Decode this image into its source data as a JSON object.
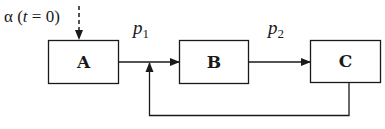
{
  "diagram": {
    "type": "block-flow",
    "colors": {
      "stroke": "#1a1a1a",
      "background": "#ffffff"
    },
    "initial_input": {
      "symbol": "α",
      "open_paren": " (",
      "variable": "t",
      "condition": " = 0)",
      "style": "dashed-arrow",
      "target": "A"
    },
    "nodes": [
      {
        "id": "A",
        "label": "A"
      },
      {
        "id": "B",
        "label": "B"
      },
      {
        "id": "C",
        "label": "C"
      }
    ],
    "edges": [
      {
        "from": "A",
        "to": "B",
        "label_main": "p",
        "label_sub": "1"
      },
      {
        "from": "B",
        "to": "C",
        "label_main": "p",
        "label_sub": "2"
      },
      {
        "from": "C",
        "to": "A-B junction",
        "label_main": "",
        "label_sub": "",
        "style": "feedback"
      }
    ]
  }
}
